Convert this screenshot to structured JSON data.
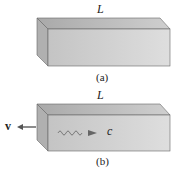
{
  "figure_a": {
    "length_label": "L",
    "caption": "(a)"
  },
  "figure_b": {
    "length_label": "L",
    "caption": "(b)",
    "velocity_label": "v",
    "light_label": "c"
  },
  "colors": {
    "top": "#b8b8b8",
    "front": "#cfcfcf",
    "side": "#a8a8a8",
    "edge": "#555555"
  }
}
